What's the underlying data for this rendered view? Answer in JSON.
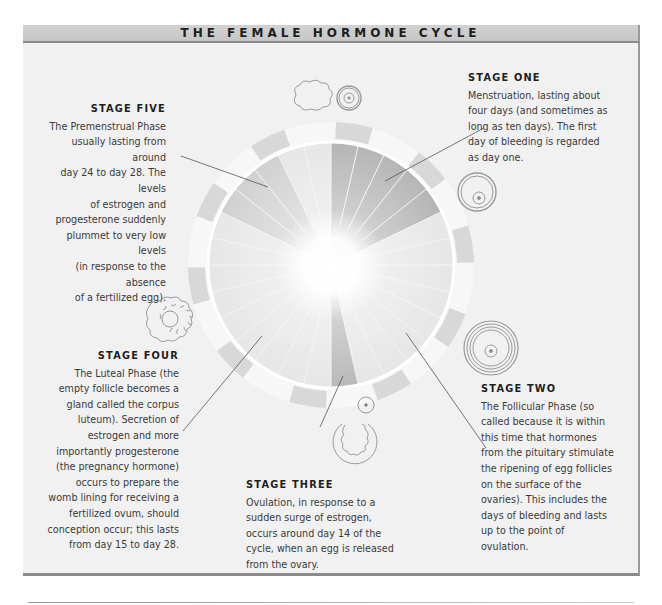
{
  "title": "THE FEMALE HORMONE CYCLE",
  "stages": [
    {
      "id": "stage-one",
      "heading": "STAGE ONE",
      "lines": [
        "Menstruation, lasting about",
        "four days (and sometimes as",
        "long as ten days). The first",
        "day of bleeding is regarded",
        "as day one."
      ]
    },
    {
      "id": "stage-two",
      "heading": "STAGE TWO",
      "lines": [
        "The Follicular Phase (so",
        "called because it is within",
        "this time that hormones",
        "from the pituitary stimulate",
        "the ripening of egg follicles",
        "on the surface of the",
        "ovaries). This includes the",
        "days of bleeding and lasts",
        "up to the point of",
        "ovulation."
      ]
    },
    {
      "id": "stage-three",
      "heading": "STAGE THREE",
      "lines": [
        "Ovulation, in response to a",
        "sudden surge of estrogen,",
        "occurs around day 14 of the",
        "cycle, when an egg is released",
        "from the ovary."
      ]
    },
    {
      "id": "stage-four",
      "heading": "STAGE FOUR",
      "lines": [
        "The Luteal Phase (the",
        "empty follicle becomes a",
        "gland called the corpus",
        "luteum). Secretion of",
        "estrogen and more",
        "importantly progesterone",
        "(the pregnancy hormone)",
        "occurs to prepare the",
        "womb lining for receiving a",
        "fertilized ovum, should",
        "conception occur; this lasts",
        "from day 15 to day 28."
      ]
    },
    {
      "id": "stage-five",
      "heading": "STAGE FIVE",
      "lines": [
        "The Premenstrual Phase",
        "usually lasting from around",
        "day 24 to day 28. The levels",
        "of estrogen and",
        "progesterone suddenly",
        "plummet to very low levels",
        "(in response to the absence",
        "of a fertilized egg)."
      ]
    }
  ],
  "diagram": {
    "cycle_days": 28,
    "colors": {
      "header_bg": "#c9c9c9",
      "panel_bg": "#f1f1f1",
      "wheel_light": "#e6e6e6",
      "wheel_dark": "#b4b4b4",
      "ring_segment": "#d8d8d8"
    }
  }
}
